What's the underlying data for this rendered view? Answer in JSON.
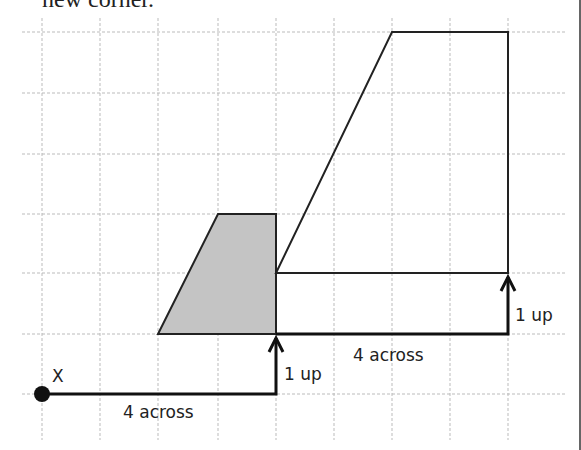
{
  "heading": "new corner.",
  "diagram": {
    "grid": {
      "x_lines": [
        42,
        100,
        158,
        218,
        276,
        334,
        392,
        450,
        508
      ],
      "y_lines": [
        32,
        93,
        154,
        214,
        273,
        334,
        394
      ],
      "color": "#bbbbbb"
    },
    "shapes": {
      "original_fill": "#c4c4c4",
      "original_points": "158,334 218,214 276,214 276,334",
      "enlarged_points": "276,273 392,32 508,32 508,273"
    },
    "point_label": "X",
    "labels": {
      "across_1": "4 across",
      "up_1": "1 up",
      "across_2": "4 across",
      "up_2": "1 up"
    }
  }
}
